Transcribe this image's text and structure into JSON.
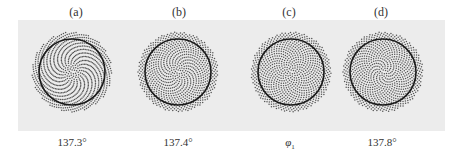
{
  "figure": {
    "background_color": "#ececec",
    "dot_color": "#555555",
    "circle_color": "#1a1a1a",
    "panels": [
      {
        "label": "(a)",
        "caption": "137.3°",
        "angle_deg": 137.3,
        "cx": 72,
        "label_x": 76,
        "caption_x": 72
      },
      {
        "label": "(b)",
        "caption": "137.4°",
        "angle_deg": 137.4,
        "cx": 178,
        "label_x": 179,
        "caption_x": 178
      },
      {
        "label": "(c)",
        "caption": "φ1",
        "caption_main": "φ",
        "caption_sub": "1",
        "angle_deg": 137.50776,
        "cx": 291,
        "label_x": 289,
        "caption_x": 290
      },
      {
        "label": "(d)",
        "caption": "137.8°",
        "angle_deg": 137.8,
        "cx": 383,
        "label_x": 381,
        "caption_x": 382
      }
    ],
    "cy": 72,
    "outer_radius": 40,
    "circle_radius": 33
  }
}
